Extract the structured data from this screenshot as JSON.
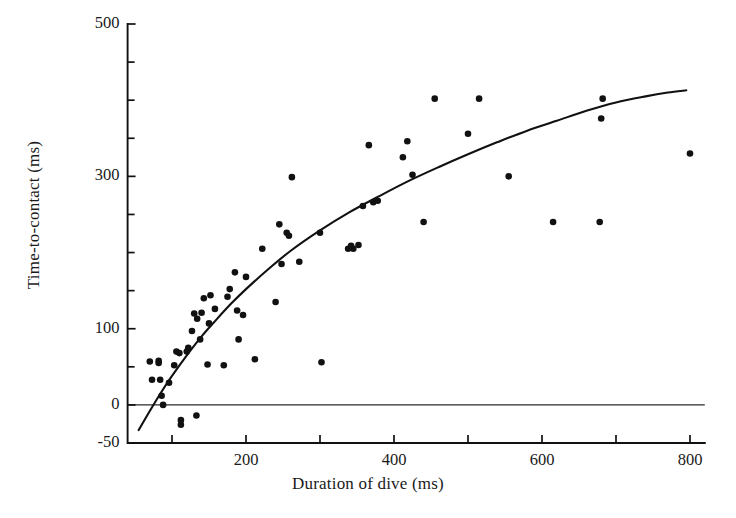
{
  "chart_data": {
    "type": "scatter",
    "title": "",
    "xlabel": "Duration of dive (ms)",
    "ylabel": "Time-to-contact (ms)",
    "xlim": [
      40,
      820
    ],
    "ylim": [
      -50,
      500
    ],
    "grid": false,
    "legend": "none",
    "x_ticks_major": [
      200,
      400,
      600,
      800
    ],
    "x_ticks_minor": [
      100,
      300,
      500,
      700
    ],
    "x_tick_labels": [
      "200",
      "400",
      "600",
      "800"
    ],
    "y_ticks_major": [
      -50,
      0,
      100,
      300,
      500
    ],
    "y_ticks_minor": [
      50,
      150,
      200,
      250,
      350,
      400,
      450
    ],
    "y_tick_labels": [
      "500",
      "300",
      "100",
      "0",
      "-50"
    ],
    "marker": "filled-circle",
    "marker_color": "#111111",
    "fit_curve_color": "#111111",
    "fit_curve_label": "fitted curve",
    "points": [
      [
        70,
        57
      ],
      [
        73,
        33
      ],
      [
        82,
        55
      ],
      [
        82,
        58
      ],
      [
        84,
        33
      ],
      [
        86,
        12
      ],
      [
        88,
        0
      ],
      [
        96,
        29
      ],
      [
        103,
        52
      ],
      [
        106,
        70
      ],
      [
        110,
        68
      ],
      [
        112,
        -20
      ],
      [
        112,
        -26
      ],
      [
        120,
        70
      ],
      [
        122,
        75
      ],
      [
        127,
        97
      ],
      [
        130,
        120
      ],
      [
        133,
        -14
      ],
      [
        134,
        113
      ],
      [
        138,
        86
      ],
      [
        140,
        121
      ],
      [
        143,
        140
      ],
      [
        148,
        53
      ],
      [
        150,
        107
      ],
      [
        152,
        144
      ],
      [
        158,
        126
      ],
      [
        170,
        52
      ],
      [
        175,
        142
      ],
      [
        178,
        152
      ],
      [
        185,
        174
      ],
      [
        188,
        124
      ],
      [
        190,
        86
      ],
      [
        196,
        118
      ],
      [
        200,
        168
      ],
      [
        212,
        60
      ],
      [
        222,
        205
      ],
      [
        240,
        135
      ],
      [
        245,
        237
      ],
      [
        248,
        185
      ],
      [
        255,
        226
      ],
      [
        258,
        222
      ],
      [
        262,
        299
      ],
      [
        272,
        188
      ],
      [
        300,
        226
      ],
      [
        302,
        56
      ],
      [
        338,
        205
      ],
      [
        342,
        209
      ],
      [
        345,
        205
      ],
      [
        352,
        210
      ],
      [
        358,
        261
      ],
      [
        366,
        341
      ],
      [
        372,
        266
      ],
      [
        378,
        268
      ],
      [
        412,
        325
      ],
      [
        418,
        346
      ],
      [
        425,
        302
      ],
      [
        440,
        240
      ],
      [
        455,
        402
      ],
      [
        500,
        356
      ],
      [
        515,
        402
      ],
      [
        555,
        300
      ],
      [
        615,
        240
      ],
      [
        678,
        240
      ],
      [
        680,
        376
      ],
      [
        682,
        402
      ],
      [
        800,
        330
      ]
    ],
    "fit_curve": [
      [
        55,
        -33
      ],
      [
        70,
        -8
      ],
      [
        85,
        16
      ],
      [
        100,
        38
      ],
      [
        120,
        65
      ],
      [
        140,
        90
      ],
      [
        160,
        112
      ],
      [
        180,
        133
      ],
      [
        200,
        152
      ],
      [
        230,
        178
      ],
      [
        260,
        202
      ],
      [
        300,
        229
      ],
      [
        340,
        253
      ],
      [
        380,
        274
      ],
      [
        420,
        294
      ],
      [
        460,
        312
      ],
      [
        500,
        329
      ],
      [
        540,
        345
      ],
      [
        580,
        360
      ],
      [
        620,
        373
      ],
      [
        660,
        386
      ],
      [
        700,
        397
      ],
      [
        740,
        405
      ],
      [
        770,
        410
      ],
      [
        795,
        413
      ]
    ]
  }
}
